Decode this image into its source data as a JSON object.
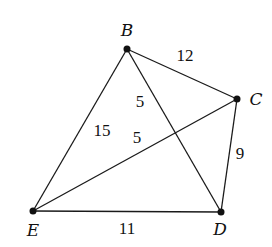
{
  "graph": {
    "nodes": [
      {
        "id": "B",
        "label": "B",
        "x": 127,
        "y": 49,
        "lx": 127,
        "ly": 36
      },
      {
        "id": "C",
        "label": "C",
        "x": 237,
        "y": 99,
        "lx": 256,
        "ly": 105
      },
      {
        "id": "D",
        "label": "D",
        "x": 221,
        "y": 212,
        "lx": 220,
        "ly": 235
      },
      {
        "id": "E",
        "label": "E",
        "x": 33,
        "y": 211,
        "lx": 33,
        "ly": 236
      }
    ],
    "edges": [
      {
        "from": "B",
        "to": "C",
        "weight": "12",
        "lx": 185,
        "ly": 61
      },
      {
        "from": "B",
        "to": "D",
        "weight": "5",
        "lx": 140,
        "ly": 107
      },
      {
        "from": "B",
        "to": "E",
        "weight": "15",
        "lx": 102,
        "ly": 136
      },
      {
        "from": "E",
        "to": "C",
        "weight": "5",
        "lx": 137,
        "ly": 143
      },
      {
        "from": "C",
        "to": "D",
        "weight": "9",
        "lx": 240,
        "ly": 159
      },
      {
        "from": "E",
        "to": "D",
        "weight": "11",
        "lx": 127,
        "ly": 234
      }
    ]
  }
}
